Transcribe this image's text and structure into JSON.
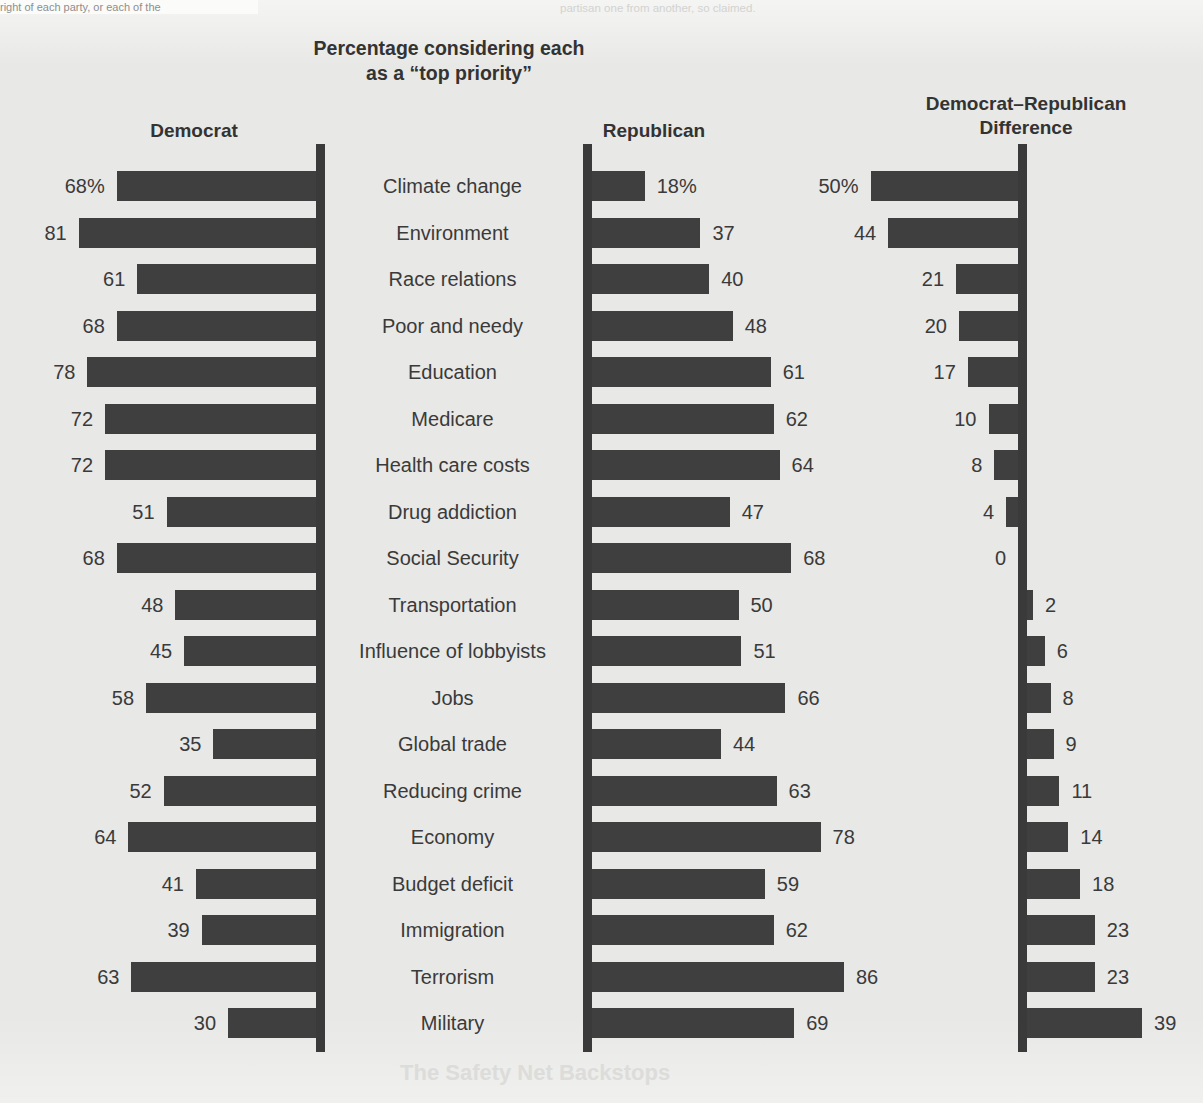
{
  "title": "Percentage considering each\nas a “top priority”",
  "title_line1": "Percentage considering each",
  "title_line2": "as a “top priority”",
  "panels": {
    "democrat": "Democrat",
    "republican": "Republican",
    "difference_line1": "Democrat–Republican",
    "difference_line2": "Difference"
  },
  "bleed": {
    "top_left": "right of each party, or each of the",
    "top_right": "partisan one from another, so claimed.",
    "bottom": "The Safety Net Backstops"
  },
  "colors": {
    "bar": "#3f3f3f",
    "axis": "#3a3a3a",
    "background": "#e8e8e6",
    "text": "#3a3a3a"
  },
  "chart_data": {
    "type": "bar",
    "title": "Percentage considering each as a “top priority”",
    "xlabel": "",
    "ylabel": "",
    "grid": false,
    "legend": "none",
    "orientation": "horizontal",
    "panels": [
      "Democrat",
      "Republican",
      "Democrat–Republican Difference"
    ],
    "xlim_democrat": [
      0,
      90
    ],
    "xlim_republican": [
      0,
      90
    ],
    "xlim_difference": [
      -45,
      55
    ],
    "categories": [
      "Climate change",
      "Environment",
      "Race relations",
      "Poor and needy",
      "Education",
      "Medicare",
      "Health care costs",
      "Drug addiction",
      "Social Security",
      "Transportation",
      "Influence of lobbyists",
      "Jobs",
      "Global trade",
      "Reducing crime",
      "Economy",
      "Budget deficit",
      "Immigration",
      "Terrorism",
      "Military"
    ],
    "series": [
      {
        "name": "Democrat",
        "values": [
          68,
          81,
          61,
          68,
          78,
          72,
          72,
          51,
          68,
          48,
          45,
          58,
          35,
          52,
          64,
          41,
          39,
          63,
          30
        ],
        "labels": [
          "68%",
          "81",
          "61",
          "68",
          "78",
          "72",
          "72",
          "51",
          "68",
          "48",
          "45",
          "58",
          "35",
          "52",
          "64",
          "41",
          "39",
          "63",
          "30"
        ]
      },
      {
        "name": "Republican",
        "values": [
          18,
          37,
          40,
          48,
          61,
          62,
          64,
          47,
          68,
          50,
          51,
          66,
          44,
          63,
          78,
          59,
          62,
          86,
          69
        ],
        "labels": [
          "18%",
          "37",
          "40",
          "48",
          "61",
          "62",
          "64",
          "47",
          "68",
          "50",
          "51",
          "66",
          "44",
          "63",
          "78",
          "59",
          "62",
          "86",
          "69"
        ]
      },
      {
        "name": "Democrat–Republican Difference",
        "values": [
          50,
          44,
          21,
          20,
          17,
          10,
          8,
          4,
          0,
          -2,
          -6,
          -8,
          -9,
          -11,
          -14,
          -18,
          -23,
          -23,
          -39
        ],
        "labels": [
          "50%",
          "44",
          "21",
          "20",
          "17",
          "10",
          "8",
          "4",
          "0",
          "2",
          "6",
          "8",
          "9",
          "11",
          "14",
          "18",
          "23",
          "23",
          "39"
        ]
      }
    ]
  }
}
